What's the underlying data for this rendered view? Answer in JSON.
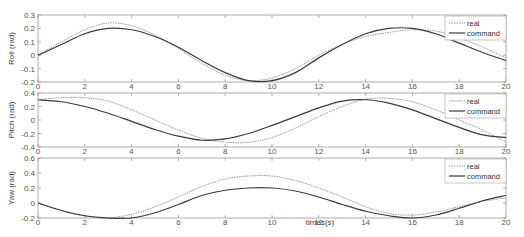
{
  "chart_data": [
    {
      "type": "line",
      "title": "",
      "xlabel": "",
      "ylabel": "Roll (rad)",
      "xlim": [
        0,
        20
      ],
      "ylim": [
        -0.2,
        0.3
      ],
      "xticks": [
        0,
        2,
        4,
        6,
        8,
        10,
        12,
        14,
        16,
        18,
        20
      ],
      "yticks": [
        -0.2,
        -0.1,
        0,
        0.1,
        0.2,
        0.3
      ],
      "ytick_labels": [
        "-0.2",
        "-0.1",
        "0",
        "0.1",
        "0.2",
        "0.3"
      ],
      "legend_position": "upper right",
      "series": [
        {
          "name": "real",
          "style": "dotted",
          "x": [
            0,
            1,
            2,
            3,
            4,
            5,
            6,
            7,
            8,
            9,
            10,
            11,
            12,
            13,
            14,
            15,
            16,
            17,
            18,
            19,
            20
          ],
          "values": [
            0,
            0.1,
            0.19,
            0.24,
            0.22,
            0.15,
            0.05,
            -0.06,
            -0.15,
            -0.19,
            -0.17,
            -0.1,
            0.0,
            0.08,
            0.14,
            0.17,
            0.19,
            0.18,
            0.13,
            0.06,
            -0.02
          ]
        },
        {
          "name": "command",
          "style": "solid",
          "x": [
            0,
            1,
            2,
            3,
            4,
            5,
            6,
            7,
            8,
            9,
            10,
            11,
            12,
            13,
            14,
            15,
            16,
            17,
            18,
            19,
            20
          ],
          "values": [
            0,
            0.08,
            0.16,
            0.2,
            0.19,
            0.14,
            0.06,
            -0.04,
            -0.13,
            -0.19,
            -0.19,
            -0.13,
            -0.02,
            0.08,
            0.16,
            0.2,
            0.2,
            0.16,
            0.09,
            0.02,
            -0.04
          ]
        }
      ]
    },
    {
      "type": "line",
      "title": "",
      "xlabel": "",
      "ylabel": "Pitch (rad)",
      "xlim": [
        0,
        20
      ],
      "ylim": [
        -0.4,
        0.4
      ],
      "xticks": [
        0,
        2,
        4,
        6,
        8,
        10,
        12,
        14,
        16,
        18,
        20
      ],
      "yticks": [
        -0.4,
        -0.2,
        0,
        0.2,
        0.4
      ],
      "ytick_labels": [
        "-0.4",
        "-0.2",
        "0",
        "0.2",
        "0.4"
      ],
      "legend_position": "upper right",
      "series": [
        {
          "name": "real",
          "style": "dotted",
          "x": [
            0,
            1,
            2,
            3,
            4,
            5,
            6,
            7,
            8,
            9,
            10,
            11,
            12,
            13,
            14,
            15,
            16,
            17,
            18,
            19,
            20
          ],
          "values": [
            0.3,
            0.33,
            0.33,
            0.28,
            0.15,
            0.0,
            -0.15,
            -0.27,
            -0.33,
            -0.33,
            -0.26,
            -0.12,
            0.05,
            0.2,
            0.31,
            0.32,
            0.27,
            0.15,
            0.0,
            -0.15,
            -0.33
          ]
        },
        {
          "name": "command",
          "style": "solid",
          "x": [
            0,
            1,
            2,
            3,
            4,
            5,
            6,
            7,
            8,
            9,
            10,
            11,
            12,
            13,
            14,
            15,
            16,
            17,
            18,
            19,
            20
          ],
          "values": [
            0.3,
            0.27,
            0.2,
            0.1,
            -0.02,
            -0.14,
            -0.24,
            -0.3,
            -0.28,
            -0.2,
            -0.08,
            0.05,
            0.18,
            0.28,
            0.3,
            0.25,
            0.15,
            0.02,
            -0.11,
            -0.22,
            -0.26
          ]
        }
      ]
    },
    {
      "type": "line",
      "title": "",
      "xlabel": "times(s)",
      "ylabel": "Yaw (rad)",
      "xlim": [
        0,
        20
      ],
      "ylim": [
        -0.2,
        0.6
      ],
      "xticks": [
        0,
        2,
        4,
        6,
        8,
        10,
        12,
        14,
        16,
        18,
        20
      ],
      "yticks": [
        -0.2,
        0,
        0.2,
        0.4,
        0.6
      ],
      "ytick_labels": [
        "-0.2",
        "0",
        "0.2",
        "0.4",
        "0.6"
      ],
      "legend_position": "upper right",
      "series": [
        {
          "name": "real",
          "style": "dotted",
          "x": [
            0,
            1,
            2,
            3,
            4,
            5,
            6,
            7,
            8,
            9,
            10,
            11,
            12,
            13,
            14,
            15,
            16,
            17,
            18,
            19,
            20
          ],
          "values": [
            0,
            -0.1,
            -0.17,
            -0.2,
            -0.15,
            -0.05,
            0.08,
            0.22,
            0.32,
            0.36,
            0.36,
            0.3,
            0.2,
            0.08,
            -0.05,
            -0.14,
            -0.16,
            -0.12,
            -0.05,
            0.02,
            0.07
          ]
        },
        {
          "name": "command",
          "style": "solid",
          "x": [
            0,
            1,
            2,
            3,
            4,
            5,
            6,
            7,
            8,
            9,
            10,
            11,
            12,
            13,
            14,
            15,
            16,
            17,
            18,
            19,
            20
          ],
          "values": [
            0,
            -0.1,
            -0.17,
            -0.2,
            -0.2,
            -0.13,
            -0.02,
            0.1,
            0.17,
            0.2,
            0.2,
            0.16,
            0.08,
            -0.02,
            -0.11,
            -0.17,
            -0.2,
            -0.16,
            -0.07,
            0.03,
            0.1
          ]
        }
      ]
    }
  ],
  "panels": [
    {
      "ylabel": "Roll (rad)"
    },
    {
      "ylabel": "Pitch (rad)"
    },
    {
      "ylabel": "Yaw (rad)"
    }
  ],
  "legend": {
    "real": "real",
    "command": "command"
  },
  "xlabel": "times(s)",
  "colors": {
    "real": "#8a8a8a",
    "command": "#3a3a3a",
    "axis": "#9a9a9a"
  }
}
